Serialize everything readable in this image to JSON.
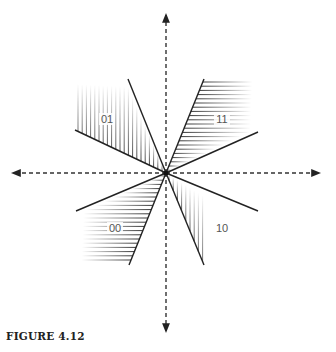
{
  "figure": {
    "caption": "FIGURE 4.12",
    "center": [
      166,
      173
    ],
    "axes": {
      "horizontal": {
        "from": [
          12,
          173
        ],
        "to": [
          320,
          173
        ],
        "style": "dashed",
        "arrows": "both"
      },
      "vertical": {
        "from": [
          166,
          14
        ],
        "to": [
          166,
          332
        ],
        "style": "dashed",
        "arrows": "both"
      }
    },
    "regions": [
      {
        "label": "01",
        "quadrant": "upper-left",
        "hatch": "vertical",
        "label_pos": [
          107,
          123
        ],
        "edges": [
          [
            128,
            79
          ],
          [
            75,
            130
          ]
        ]
      },
      {
        "label": "11",
        "quadrant": "upper-right",
        "hatch": "horizontal",
        "label_pos": [
          222,
          123
        ],
        "edges": [
          [
            204,
            79
          ],
          [
            258,
            132
          ]
        ]
      },
      {
        "label": "00",
        "quadrant": "lower-left",
        "hatch": "horizontal",
        "label_pos": [
          115,
          232
        ],
        "edges": [
          [
            76,
            211
          ],
          [
            129,
            265
          ]
        ]
      },
      {
        "label": "10",
        "quadrant": "lower-right",
        "hatch": "vertical",
        "label_pos": [
          222,
          232
        ],
        "edges": [
          [
            258,
            211
          ],
          [
            204,
            265
          ]
        ]
      }
    ]
  }
}
